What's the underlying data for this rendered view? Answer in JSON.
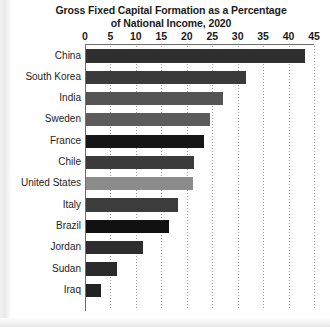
{
  "chart_data": {
    "type": "bar",
    "orientation": "horizontal",
    "title": "Gross Fixed Capital Formation as a Percentage of National Income, 2020",
    "title_line1": "Gross Fixed Capital Formation as a Percentage",
    "title_line2": "of National Income, 2020",
    "xlabel": "",
    "ylabel": "",
    "xlim": [
      0,
      45
    ],
    "xticks": [
      0,
      5,
      10,
      15,
      20,
      25,
      30,
      35,
      40,
      45
    ],
    "xtick_labels": [
      "0",
      "5",
      "10",
      "15",
      "20",
      "25",
      "30",
      "35",
      "40",
      "45"
    ],
    "grid": "vertical-dotted",
    "legend": "none",
    "categories": [
      "China",
      "South Korea",
      "India",
      "Sweden",
      "France",
      "Chile",
      "United States",
      "Italy",
      "Brazil",
      "Jordan",
      "Sudan",
      "Iraq"
    ],
    "values": [
      43.0,
      31.4,
      27.0,
      24.4,
      23.2,
      21.2,
      21.0,
      18.0,
      16.3,
      11.2,
      6.0,
      3.0
    ],
    "bar_colors": [
      "#2f2f2f",
      "#3a3a3a",
      "#545454",
      "#5c5c5c",
      "#161616",
      "#3b3b3b",
      "#8c8c8c",
      "#3c3c3c",
      "#111111",
      "#2e2e2e",
      "#2a2a2a",
      "#232323"
    ],
    "bars": [
      {
        "category": "China",
        "value": 43.0,
        "color": "#2f2f2f"
      },
      {
        "category": "South Korea",
        "value": 31.4,
        "color": "#3a3a3a"
      },
      {
        "category": "India",
        "value": 27.0,
        "color": "#545454"
      },
      {
        "category": "Sweden",
        "value": 24.4,
        "color": "#5c5c5c"
      },
      {
        "category": "France",
        "value": 23.2,
        "color": "#161616"
      },
      {
        "category": "Chile",
        "value": 21.2,
        "color": "#3b3b3b"
      },
      {
        "category": "United States",
        "value": 21.0,
        "color": "#8c8c8c"
      },
      {
        "category": "Italy",
        "value": 18.0,
        "color": "#3c3c3c"
      },
      {
        "category": "Brazil",
        "value": 16.3,
        "color": "#111111"
      },
      {
        "category": "Jordan",
        "value": 11.2,
        "color": "#2e2e2e"
      },
      {
        "category": "Sudan",
        "value": 6.0,
        "color": "#2a2a2a"
      },
      {
        "category": "Iraq",
        "value": 3.0,
        "color": "#232323"
      }
    ]
  },
  "colors": {
    "axis": "#6d6d6d",
    "grid": "#9a9a9a",
    "text": "#1b1b1b",
    "background": "#ffffff"
  }
}
